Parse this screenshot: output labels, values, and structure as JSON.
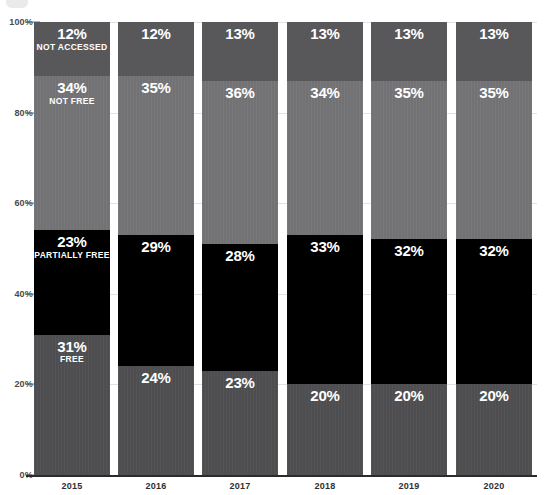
{
  "chart_data": {
    "type": "bar",
    "subtype": "stacked-100-percent",
    "title": "",
    "subtitle": "",
    "xlabel": "",
    "ylabel": "",
    "ylim": [
      0,
      100
    ],
    "yticks": [
      "0%",
      "20%",
      "40%",
      "60%",
      "80%",
      "100%"
    ],
    "ytick_values": [
      0,
      20,
      40,
      60,
      80,
      100
    ],
    "grid": true,
    "legend_position": "in-bar-labels",
    "categories": [
      "2015",
      "2016",
      "2017",
      "2018",
      "2019",
      "2020"
    ],
    "stack_order_bottom_to_top": [
      "Free",
      "Partially Free",
      "Not Free",
      "Not Accessed"
    ],
    "series": [
      {
        "name": "Free",
        "label": "FREE",
        "color": "#4e4e50",
        "values": [
          31,
          24,
          23,
          20,
          20,
          20
        ],
        "value_labels": [
          "31%",
          "24%",
          "23%",
          "20%",
          "20%",
          "20%"
        ]
      },
      {
        "name": "Partially Free",
        "label": "PARTIALLY FREE",
        "color": "#000000",
        "values": [
          23,
          29,
          28,
          33,
          32,
          32
        ],
        "value_labels": [
          "23%",
          "29%",
          "28%",
          "33%",
          "32%",
          "32%"
        ]
      },
      {
        "name": "Not Free",
        "label": "NOT FREE",
        "color": "#727275",
        "values": [
          34,
          35,
          36,
          34,
          35,
          35
        ],
        "value_labels": [
          "34%",
          "35%",
          "36%",
          "34%",
          "35%",
          "35%"
        ]
      },
      {
        "name": "Not Accessed",
        "label": "NOT ACCESSED",
        "color": "#58585a",
        "values": [
          12,
          12,
          13,
          13,
          13,
          13
        ],
        "value_labels": [
          "12%",
          "12%",
          "13%",
          "13%",
          "13%",
          "13%"
        ]
      }
    ],
    "category_labels_shown_on_bar_index": 0,
    "colors": {
      "free": "#4e4e50",
      "partially_free": "#000000",
      "not_free": "#727275",
      "not_accessed": "#58585a",
      "gridline": "#e2e2e2",
      "axis": "#2b2b2b",
      "label_text": "#ffffff",
      "tick_text": "#4a4a4a"
    }
  }
}
